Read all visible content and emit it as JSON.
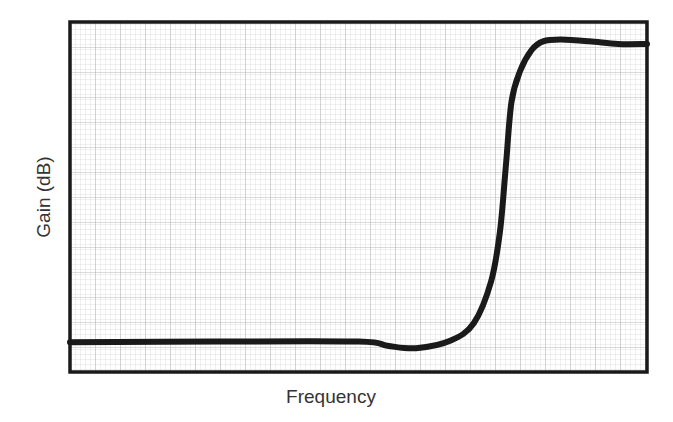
{
  "chart_data": {
    "type": "line",
    "title": "",
    "xlabel": "Frequency",
    "ylabel": "Gain (dB)",
    "grid": true,
    "legend": null,
    "x_ticks": [],
    "y_ticks": [],
    "xlim": [
      0,
      1
    ],
    "ylim": [
      0,
      1
    ],
    "series": [
      {
        "name": "High-pass filter response",
        "x": [
          0.0,
          0.25,
          0.5,
          0.55,
          0.6,
          0.66,
          0.7,
          0.73,
          0.745,
          0.755,
          0.765,
          0.78,
          0.8,
          0.82,
          0.85,
          0.9,
          0.95,
          1.0
        ],
        "y": [
          0.085,
          0.087,
          0.087,
          0.075,
          0.068,
          0.09,
          0.14,
          0.26,
          0.4,
          0.58,
          0.77,
          0.86,
          0.92,
          0.945,
          0.95,
          0.945,
          0.937,
          0.937
        ]
      }
    ],
    "colors": {
      "line": "#1a1a1a",
      "frame": "#1a1a1a",
      "grid": "#c8c8c8",
      "background": "#ffffff"
    }
  }
}
